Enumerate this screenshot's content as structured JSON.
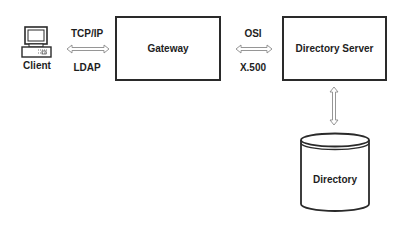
{
  "diagram": {
    "nodes": {
      "client": {
        "label": "Client",
        "icon": "computer-icon"
      },
      "gateway": {
        "label": "Gateway"
      },
      "directory_server": {
        "label": "Directory Server"
      },
      "directory": {
        "label": "Directory",
        "shape": "cylinder"
      }
    },
    "edges": {
      "client_gateway": {
        "top_label": "TCP/IP",
        "bottom_label": "LDAP",
        "direction": "bidirectional"
      },
      "gateway_server": {
        "top_label": "OSI",
        "bottom_label": "X.500",
        "direction": "bidirectional"
      },
      "server_directory": {
        "direction": "bidirectional"
      }
    },
    "colors": {
      "stroke": "#2a2a2a",
      "background": "#ffffff"
    }
  }
}
